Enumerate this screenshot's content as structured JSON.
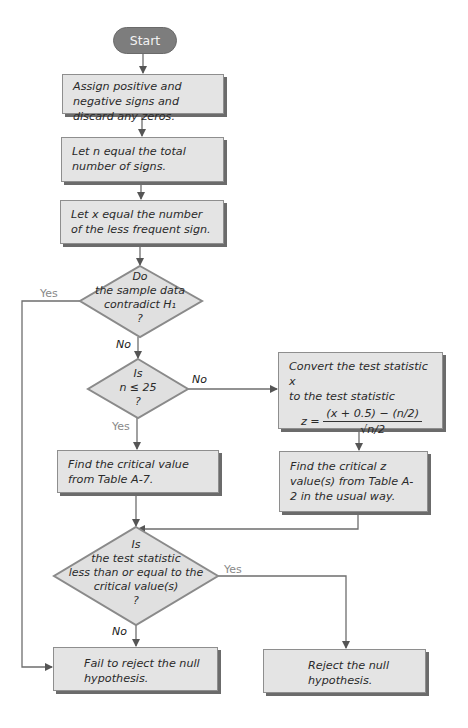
{
  "flowchart": {
    "start": "Start",
    "steps": {
      "assign_signs": "Assign positive and negative signs and discard any zeros.",
      "let_n": "Let n equal the total number of signs.",
      "let_x": "Let x equal the number of the less frequent sign.",
      "find_critical_table": "Find the critical value from Table A-7.",
      "convert_line1": "Convert the test statistic x",
      "convert_line2": "to the test statistic",
      "formula_lhs": "z =",
      "formula_num": "(x + 0.5) − (n/2)",
      "formula_den": "√n/2",
      "find_critical_z": "Find the critical z value(s) from Table A-2 in the usual way.",
      "fail_reject": "Fail to reject the null hypothesis.",
      "reject": "Reject the null hypothesis."
    },
    "decisions": {
      "contradict": [
        "Do",
        "the sample data",
        "contradict H₁",
        "?"
      ],
      "n_le_25": [
        "Is",
        "n ≤ 25",
        "?"
      ],
      "test_stat": [
        "Is",
        "the test statistic",
        "less than or equal to the",
        "critical value(s)",
        "?"
      ]
    },
    "labels": {
      "yes": "Yes",
      "no": "No"
    },
    "colors": {
      "box_fill": "#e4e4e4",
      "box_border": "#8e8e8e",
      "shadow": "#6b6b6b",
      "start_fill": "#7d7d7d",
      "line": "#6e6e6e"
    }
  }
}
